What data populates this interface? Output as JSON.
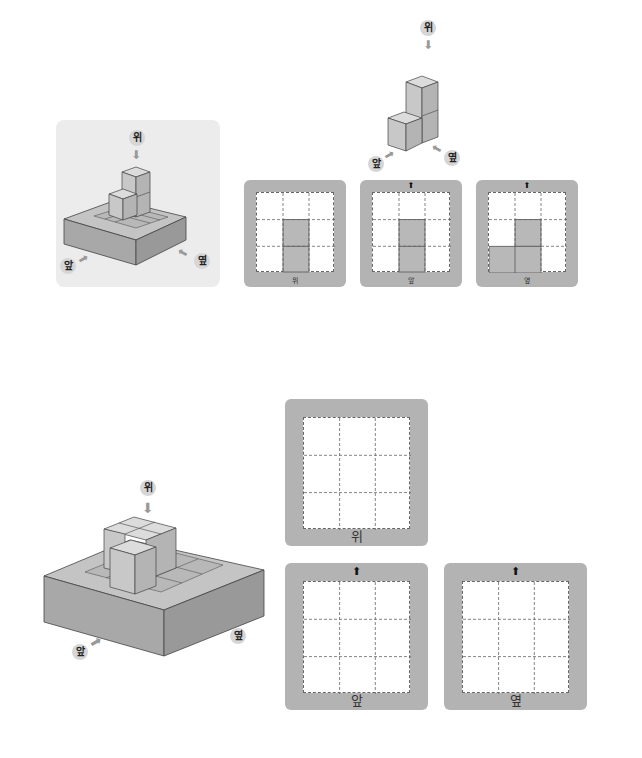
{
  "colors": {
    "card_frame": "#b3b3b3",
    "cube_top": "#dcdcdc",
    "cube_front": "#c8c8c8",
    "cube_side": "#b4b4b4",
    "base_top": "#c4c4c4",
    "base_front": "#a8a8a8",
    "base_side": "#999999",
    "filled_cell": "#b8b8b8",
    "example_panel_bg": "#ececec"
  },
  "directions": {
    "top": "위",
    "front": "앞",
    "side": "옆"
  },
  "example": {
    "shape_labels": {
      "top": "위",
      "front": "앞",
      "side": "옆"
    },
    "views": [
      {
        "name": "top-view",
        "label": "위",
        "show_arrow": false,
        "filled": [
          [
            1,
            1
          ],
          [
            2,
            1
          ]
        ]
      },
      {
        "name": "front-view",
        "label": "앞",
        "show_arrow": true,
        "filled": [
          [
            1,
            1
          ],
          [
            2,
            1
          ]
        ]
      },
      {
        "name": "side-view",
        "label": "옆",
        "show_arrow": true,
        "filled": [
          [
            1,
            1
          ],
          [
            2,
            0
          ],
          [
            2,
            1
          ]
        ]
      }
    ]
  },
  "problem": {
    "shape_labels": {
      "top": "위",
      "front": "앞",
      "side": "옆"
    },
    "views": [
      {
        "name": "top-view",
        "label": "위",
        "show_arrow": false
      },
      {
        "name": "front-view",
        "label": "앞",
        "show_arrow": true
      },
      {
        "name": "side-view",
        "label": "옆",
        "show_arrow": true
      }
    ]
  },
  "icons": {
    "up_arrow": "⬆",
    "down_arrow": "⬇"
  }
}
